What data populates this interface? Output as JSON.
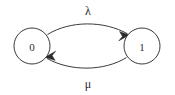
{
  "diagram": {
    "type": "state-transition-diagram",
    "background_color": "#ffffff",
    "stroke_color": "#3a3a3a",
    "text_color": "#2b2b2b",
    "nodes": [
      {
        "id": "state-0",
        "label": "0",
        "cx": 32,
        "cy": 46,
        "r": 18
      },
      {
        "id": "state-1",
        "label": "1",
        "cx": 142,
        "cy": 46,
        "r": 18
      }
    ],
    "edges": [
      {
        "id": "edge-0-to-1",
        "label": "λ",
        "from": "state-0",
        "to": "state-1",
        "direction": "right",
        "label_x": 88,
        "label_y": 11
      },
      {
        "id": "edge-1-to-0",
        "label": "μ",
        "from": "state-1",
        "to": "state-0",
        "direction": "left",
        "label_x": 88,
        "label_y": 84
      }
    ]
  }
}
